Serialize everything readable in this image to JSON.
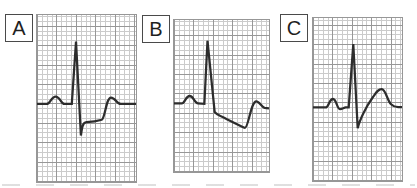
{
  "panels": [
    {
      "label": "A",
      "trace_path": "M0,90 L10,90 C13.5,90 14.5,82.5 19,82.5 C23.5,82.5 24.5,90 28,90 L35.5,90 L39.8,27 L44.8,122 C45.8,114 46.5,108.8 50.5,108.5 C56,108.2 62,107.2 66,106 C69.5,104.8 70.5,83.5 75.5,83.5 C80,83.5 81,90 85.5,90 L101,90"
    },
    {
      "label": "B",
      "trace_path": "M0,84.5 L8,84.5 C11,84.5 12,77 16,77 C20,77 21,84.5 24.5,84.5 L31,85 L34.2,21 L41.5,93 C43,95.5 48,97.5 54,100.5 C60,103.5 66,106.5 69,108 C70.5,108.8 71.5,109.2 72.5,109.2 C76,109.2 78.5,82.5 84,82.5 C87.5,82.5 89,88 92.5,89 L97,89.5"
    },
    {
      "label": "C",
      "trace_path": "M0,90.5 L13,90.5 C16,90.5 16.5,82 20.5,82 C24,82 24.5,92 27.5,92.2 C29.5,92.4 31.5,90.8 33.5,90.5 L36.5,90.5 L41.2,26.5 L45.7,111.5 C47.5,104 54,90 61,80.5 C64.5,75.7 66.5,72 70.3,72 C74.3,72 75.8,83.5 79.8,87.3 C82.3,89.6 84.8,90.2 87,90.3 L91,90.3"
    }
  ],
  "colors": {
    "background": "#ffffff",
    "grid_minor": "#cbcbcb",
    "grid_major": "#979797",
    "trace": "#2d2d2d",
    "label_text": "#1f1f1f",
    "label_border": "#4a4a4a"
  }
}
